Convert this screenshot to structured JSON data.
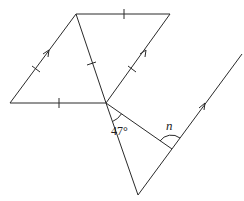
{
  "figure": {
    "type": "geometry-diagram",
    "labels": {
      "angle_known": "47°",
      "angle_unknown": "n"
    },
    "points": {
      "A_top_left": [
        76,
        14
      ],
      "B_top_right": [
        170,
        14
      ],
      "C_bottom_left": [
        10,
        103
      ],
      "D_center": [
        106,
        103
      ],
      "E_bottom": [
        138,
        195
      ],
      "F_right_top": [
        242,
        54
      ],
      "G_intersection": [
        172,
        149
      ]
    },
    "markings": {
      "equal_tick_segments": [
        "A-B",
        "C-D",
        "A-C",
        "A-D",
        "B-D"
      ],
      "parallel_arrow_segments": [
        "C-A",
        "D-B",
        "E-F"
      ]
    },
    "colors": {
      "line": "#2a2a2a",
      "background": "#ffffff"
    }
  }
}
